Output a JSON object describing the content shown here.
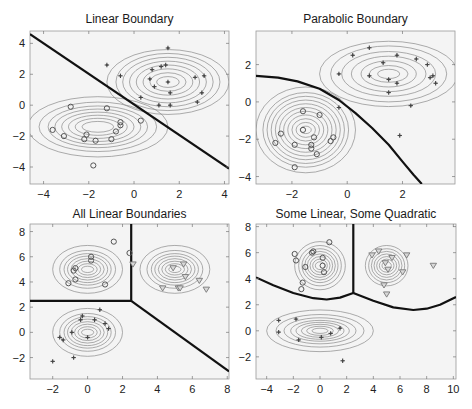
{
  "figure": {
    "panels": [
      {
        "id": "linear",
        "title": "Linear Boundary"
      },
      {
        "id": "parabolic",
        "title": "Parabolic Boundary"
      },
      {
        "id": "all-linear",
        "title": "All Linear Boundaries"
      },
      {
        "id": "some-linear-quadratic",
        "title": "Some Linear, Some Quadratic"
      }
    ]
  },
  "colors": {
    "background": "#f4f4f4",
    "contour": "#8a8a8a",
    "boundary": "#111111",
    "marker": "#555555",
    "triangle_fill": "#d8d8d8"
  },
  "chart_data": [
    {
      "type": "scatter",
      "title": "Linear Boundary",
      "xlabel": "",
      "ylabel": "",
      "xlim": [
        -4.6,
        4.2
      ],
      "ylim": [
        -5.1,
        4.8
      ],
      "xticks": [
        -4,
        -2,
        0,
        2,
        4
      ],
      "yticks": [
        -4,
        -2,
        0,
        2,
        4
      ],
      "xtick_labels": [
        "−4",
        "−2",
        "0",
        "2",
        "4"
      ],
      "ytick_labels": [
        "−4",
        "−2",
        "0",
        "2",
        "4"
      ],
      "grid": false,
      "frame": {
        "x": 30,
        "y": 31,
        "w": 199,
        "h": 153
      },
      "series": [
        {
          "name": "class 1",
          "marker": "circle",
          "points": [
            [
              -3.6,
              -1.6
            ],
            [
              -3.1,
              -2.0
            ],
            [
              -2.8,
              -0.1
            ],
            [
              -2.2,
              -2.2
            ],
            [
              -2.1,
              -1.9
            ],
            [
              -1.8,
              -3.9
            ],
            [
              -1.7,
              -2.3
            ],
            [
              -1.2,
              -0.2
            ],
            [
              -1.0,
              -2.2
            ],
            [
              -0.8,
              -1.7
            ],
            [
              -0.6,
              -1.1
            ],
            [
              -0.6,
              -1.3
            ],
            [
              0.3,
              -1.0
            ]
          ]
        },
        {
          "name": "class 2",
          "marker": "plus",
          "points": [
            [
              -1.2,
              2.6
            ],
            [
              -0.6,
              1.9
            ],
            [
              0.3,
              0.5
            ],
            [
              0.7,
              1.7
            ],
            [
              0.8,
              2.3
            ],
            [
              0.9,
              1.2
            ],
            [
              1.1,
              0.0
            ],
            [
              1.2,
              2.5
            ],
            [
              1.4,
              2.6
            ],
            [
              1.5,
              1.5
            ],
            [
              1.5,
              3.7
            ],
            [
              1.6,
              0.8
            ],
            [
              1.6,
              0.0
            ],
            [
              2.7,
              1.8
            ],
            [
              2.8,
              0.2
            ],
            [
              3.0,
              0.8
            ],
            [
              3.1,
              1.9
            ]
          ]
        }
      ],
      "gaussians": [
        {
          "cx": -1.6,
          "cy": -1.4,
          "rx": [
            0.7,
            1.0,
            1.3,
            1.6,
            1.9,
            2.2,
            2.6,
            3.1
          ],
          "ry": [
            0.35,
            0.55,
            0.75,
            0.95,
            1.15,
            1.35,
            1.6,
            1.95
          ]
        },
        {
          "cx": 1.5,
          "cy": 1.5,
          "rx": [
            0.5,
            0.8,
            1.1,
            1.4,
            1.7,
            2.0,
            2.3,
            2.7
          ],
          "ry": [
            0.35,
            0.6,
            0.85,
            1.1,
            1.35,
            1.6,
            1.85,
            2.1
          ]
        }
      ],
      "boundary": {
        "kind": "line",
        "points": [
          [
            -4.6,
            4.6
          ],
          [
            4.2,
            -4.1
          ]
        ]
      }
    },
    {
      "type": "scatter",
      "title": "Parabolic Boundary",
      "xlabel": "",
      "ylabel": "",
      "xlim": [
        -3.3,
        3.9
      ],
      "ylim": [
        -4.4,
        3.8
      ],
      "xticks": [
        -2,
        0,
        2
      ],
      "yticks": [
        -4,
        -2,
        0,
        2
      ],
      "xtick_labels": [
        "−2",
        "0",
        "2"
      ],
      "ytick_labels": [
        "−4",
        "−2",
        "0",
        "2"
      ],
      "grid": false,
      "frame": {
        "x": 256,
        "y": 31,
        "w": 199,
        "h": 153
      },
      "series": [
        {
          "name": "class 1",
          "marker": "circle",
          "points": [
            [
              -2.6,
              -2.2
            ],
            [
              -2.4,
              -1.7
            ],
            [
              -1.9,
              -2.3
            ],
            [
              -1.9,
              -3.5
            ],
            [
              -1.6,
              -0.5
            ],
            [
              -1.6,
              -1.5
            ],
            [
              -1.3,
              -2.3
            ],
            [
              -1.3,
              -2.5
            ],
            [
              -1.2,
              -1.9
            ],
            [
              -1.1,
              -2.8
            ],
            [
              -1.0,
              -0.7
            ],
            [
              -0.6,
              -2.1
            ],
            [
              -0.5,
              -1.9
            ]
          ]
        },
        {
          "name": "class 2",
          "marker": "plus",
          "points": [
            [
              -0.3,
              -0.3
            ],
            [
              -0.3,
              1.5
            ],
            [
              0.2,
              2.5
            ],
            [
              0.8,
              1.4
            ],
            [
              0.8,
              2.9
            ],
            [
              1.3,
              2.1
            ],
            [
              1.5,
              0.5
            ],
            [
              1.5,
              1.2
            ],
            [
              1.8,
              1.0
            ],
            [
              1.8,
              2.5
            ],
            [
              1.9,
              -1.8
            ],
            [
              2.3,
              -0.2
            ],
            [
              2.5,
              2.3
            ],
            [
              2.9,
              2.0
            ],
            [
              3.0,
              1.3
            ],
            [
              3.1,
              1.4
            ],
            [
              3.2,
              1.0
            ]
          ]
        }
      ],
      "gaussians": [
        {
          "cx": -1.5,
          "cy": -1.5,
          "rx": [
            0.2,
            0.35,
            0.5,
            0.65,
            0.8,
            0.95,
            1.1,
            1.25,
            1.4,
            1.55,
            1.8
          ],
          "ry": [
            0.2,
            0.4,
            0.6,
            0.8,
            1.0,
            1.2,
            1.4,
            1.6,
            1.8,
            2.0,
            2.3
          ]
        },
        {
          "cx": 1.5,
          "cy": 1.5,
          "rx": [
            0.4,
            0.7,
            1.0,
            1.35,
            1.7,
            2.1,
            2.5
          ],
          "ry": [
            0.25,
            0.45,
            0.7,
            0.95,
            1.2,
            1.5,
            1.75
          ]
        }
      ],
      "boundary": {
        "kind": "curve",
        "points": [
          [
            -3.3,
            1.4
          ],
          [
            -2.5,
            1.3
          ],
          [
            -1.8,
            1.1
          ],
          [
            -1.0,
            0.7
          ],
          [
            -0.3,
            0.1
          ],
          [
            0.3,
            -0.6
          ],
          [
            0.9,
            -1.4
          ],
          [
            1.5,
            -2.3
          ],
          [
            2.0,
            -3.2
          ],
          [
            2.4,
            -3.9
          ],
          [
            2.7,
            -4.4
          ]
        ]
      }
    },
    {
      "type": "scatter",
      "title": "All Linear Boundaries",
      "xlabel": "",
      "ylabel": "",
      "xlim": [
        -3.3,
        8.1
      ],
      "ylim": [
        -3.7,
        8.6
      ],
      "xticks": [
        -2,
        0,
        2,
        4,
        6,
        8
      ],
      "yticks": [
        -2,
        0,
        2,
        4,
        6,
        8
      ],
      "xtick_labels": [
        "−2",
        "0",
        "2",
        "4",
        "6",
        "8"
      ],
      "ytick_labels": [
        "−2",
        "0",
        "2",
        "4",
        "6",
        "8"
      ],
      "grid": false,
      "frame": {
        "x": 30,
        "y": 224,
        "w": 199,
        "h": 155
      },
      "series": [
        {
          "name": "class 1",
          "marker": "circle",
          "points": [
            [
              -1.1,
              3.9
            ],
            [
              -0.8,
              4.9
            ],
            [
              -0.7,
              5.1
            ],
            [
              -0.7,
              4.2
            ],
            [
              0.2,
              5.7
            ],
            [
              0.2,
              6.0
            ],
            [
              1.0,
              3.8
            ],
            [
              1.5,
              7.2
            ],
            [
              2.4,
              6.3
            ]
          ]
        },
        {
          "name": "class 2",
          "marker": "triangle",
          "points": [
            [
              2.6,
              5.4
            ],
            [
              4.3,
              3.5
            ],
            [
              4.9,
              5.1
            ],
            [
              5.2,
              3.5
            ],
            [
              5.3,
              3.5
            ],
            [
              5.5,
              5.4
            ],
            [
              5.6,
              4.4
            ],
            [
              6.4,
              4.1
            ],
            [
              6.8,
              3.4
            ]
          ]
        },
        {
          "name": "class 3",
          "marker": "plus",
          "points": [
            [
              -2.0,
              -2.3
            ],
            [
              -1.6,
              -0.4
            ],
            [
              -1.4,
              -0.6
            ],
            [
              -0.9,
              0.0
            ],
            [
              -0.8,
              -2.0
            ],
            [
              -0.4,
              1.0
            ],
            [
              -0.3,
              1.3
            ],
            [
              0.0,
              -0.4
            ],
            [
              0.4,
              1.0
            ],
            [
              0.7,
              1.8
            ],
            [
              1.0,
              0.7
            ],
            [
              1.2,
              0.3
            ]
          ]
        }
      ],
      "gaussians": [
        {
          "cx": 0.0,
          "cy": 5.0,
          "rx": [
            0.35,
            0.55,
            0.75,
            0.95,
            1.15,
            1.35,
            1.6,
            2.0
          ],
          "ry": [
            0.25,
            0.45,
            0.65,
            0.85,
            1.05,
            1.25,
            1.5,
            1.9
          ]
        },
        {
          "cx": 5.0,
          "cy": 5.0,
          "rx": [
            0.35,
            0.55,
            0.75,
            0.95,
            1.15,
            1.35,
            1.6,
            2.0
          ],
          "ry": [
            0.25,
            0.45,
            0.65,
            0.85,
            1.05,
            1.25,
            1.5,
            1.9
          ]
        },
        {
          "cx": 0.0,
          "cy": 0.0,
          "rx": [
            0.35,
            0.55,
            0.75,
            0.95,
            1.15,
            1.35,
            1.6,
            2.0
          ],
          "ry": [
            0.25,
            0.45,
            0.65,
            0.85,
            1.05,
            1.25,
            1.5,
            1.9
          ]
        }
      ],
      "boundary": {
        "kind": "multi",
        "segments": [
          [
            [
              -3.3,
              2.5
            ],
            [
              2.5,
              2.5
            ]
          ],
          [
            [
              2.5,
              2.5
            ],
            [
              2.5,
              8.6
            ]
          ],
          [
            [
              2.5,
              2.5
            ],
            [
              8.1,
              -3.1
            ]
          ]
        ]
      }
    },
    {
      "type": "scatter",
      "title": "Some Linear, Some Quadratic",
      "xlabel": "",
      "ylabel": "",
      "xlim": [
        -4.8,
        10.2
      ],
      "ylim": [
        -3.7,
        8.2
      ],
      "xticks": [
        -4,
        -2,
        0,
        2,
        4,
        6,
        8,
        10
      ],
      "yticks": [
        -2,
        0,
        2,
        4,
        6,
        8
      ],
      "xtick_labels": [
        "−4",
        "−2",
        "0",
        "2",
        "4",
        "6",
        "8",
        "10"
      ],
      "ytick_labels": [
        "−2",
        "0",
        "2",
        "4",
        "6",
        "8"
      ],
      "grid": false,
      "frame": {
        "x": 256,
        "y": 224,
        "w": 200,
        "h": 155
      },
      "series": [
        {
          "name": "class 1",
          "marker": "circle",
          "points": [
            [
              -1.9,
              5.9
            ],
            [
              -1.8,
              5.4
            ],
            [
              -1.4,
              3.2
            ],
            [
              -1.3,
              3.7
            ],
            [
              -1.1,
              4.9
            ],
            [
              -0.6,
              6.0
            ],
            [
              -0.5,
              6.1
            ],
            [
              0.2,
              5.6
            ],
            [
              0.2,
              5.0
            ],
            [
              0.3,
              4.5
            ],
            [
              0.7,
              6.8
            ]
          ]
        },
        {
          "name": "class 2",
          "marker": "triangle",
          "points": [
            [
              3.9,
              5.8
            ],
            [
              4.4,
              6.1
            ],
            [
              4.8,
              3.5
            ],
            [
              4.9,
              5.2
            ],
            [
              5.0,
              2.8
            ],
            [
              5.1,
              4.7
            ],
            [
              5.4,
              5.6
            ],
            [
              6.2,
              4.5
            ],
            [
              6.5,
              5.8
            ],
            [
              8.5,
              5.0
            ]
          ]
        },
        {
          "name": "class 3",
          "marker": "plus",
          "points": [
            [
              -3.1,
              0.8
            ],
            [
              -3.1,
              -0.1
            ],
            [
              -1.8,
              0.9
            ],
            [
              -1.6,
              -0.7
            ],
            [
              0.1,
              -0.5
            ],
            [
              0.8,
              -0.2
            ],
            [
              1.5,
              0.2
            ],
            [
              1.7,
              -2.3
            ]
          ]
        }
      ],
      "gaussians": [
        {
          "cx": 0.0,
          "cy": 5.0,
          "rx": [
            0.35,
            0.55,
            0.75,
            0.95,
            1.15,
            1.35,
            1.6,
            1.9
          ],
          "ry": [
            0.3,
            0.5,
            0.7,
            0.9,
            1.1,
            1.3,
            1.55,
            1.85
          ]
        },
        {
          "cx": 5.0,
          "cy": 5.0,
          "rx": [
            0.35,
            0.55,
            0.75,
            0.95,
            1.15,
            1.35,
            1.6
          ],
          "ry": [
            0.3,
            0.5,
            0.7,
            0.9,
            1.1,
            1.3,
            1.55
          ]
        },
        {
          "cx": 0.0,
          "cy": 0.0,
          "rx": [
            0.6,
            1.0,
            1.4,
            1.8,
            2.2,
            2.7,
            3.3,
            4.0
          ],
          "ry": [
            0.2,
            0.35,
            0.5,
            0.65,
            0.8,
            1.0,
            1.25,
            1.6
          ]
        }
      ],
      "boundary": {
        "kind": "multi",
        "segments": [
          [
            [
              -4.8,
              4.1
            ],
            [
              -3.5,
              3.5
            ],
            [
              -2.0,
              2.9
            ],
            [
              -0.5,
              2.5
            ],
            [
              0.5,
              2.4
            ],
            [
              1.5,
              2.55
            ],
            [
              2.5,
              2.9
            ]
          ],
          [
            [
              2.5,
              2.9
            ],
            [
              2.5,
              8.2
            ]
          ],
          [
            [
              2.5,
              2.9
            ],
            [
              4.0,
              2.3
            ],
            [
              5.5,
              1.8
            ],
            [
              7.0,
              1.6
            ],
            [
              8.0,
              1.7
            ],
            [
              9.0,
              2.0
            ],
            [
              10.2,
              2.6
            ]
          ]
        ]
      }
    }
  ]
}
